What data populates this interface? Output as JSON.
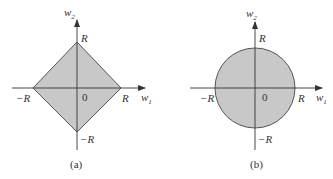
{
  "panels": [
    {
      "id": "a",
      "caption": "(a)",
      "shape": "diamond",
      "y_axis_label": "w",
      "y_axis_sub": "2",
      "x_axis_label": "w",
      "x_axis_sub": "1",
      "top_label": "R",
      "right_label": "R",
      "left_label": "−R",
      "bottom_label": "−R",
      "origin_label": "0"
    },
    {
      "id": "b",
      "caption": "(b)",
      "shape": "circle",
      "y_axis_label": "w",
      "y_axis_sub": "2",
      "x_axis_label": "w",
      "x_axis_sub": "1",
      "top_label": "R",
      "right_label": "R",
      "left_label": "−R",
      "bottom_label": "−R",
      "origin_label": "0"
    }
  ],
  "colors": {
    "fill": "#c8c8c8",
    "stroke": "#555555",
    "axis": "#333333"
  }
}
